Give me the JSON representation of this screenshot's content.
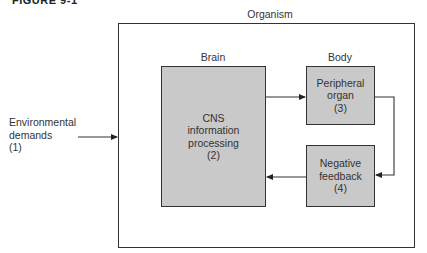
{
  "figure": {
    "title": "FIGURE 9-1"
  },
  "diagram": {
    "containers": {
      "organism": "Organism",
      "brain": "Brain",
      "body": "Body"
    },
    "nodes": [
      {
        "id": 1,
        "lines": [
          "Environmental",
          "demands",
          "(1)"
        ]
      },
      {
        "id": 2,
        "lines": [
          "CNS",
          "information",
          "processing",
          "(2)"
        ]
      },
      {
        "id": 3,
        "lines": [
          "Peripheral",
          "organ",
          "(3)"
        ]
      },
      {
        "id": 4,
        "lines": [
          "Negative",
          "feedback",
          "(4)"
        ]
      }
    ],
    "edges": [
      {
        "from": 1,
        "to": 2,
        "label": ""
      },
      {
        "from": 2,
        "to": 3,
        "label": ""
      },
      {
        "from": 3,
        "to": 4,
        "label": ""
      },
      {
        "from": 4,
        "to": 2,
        "label": ""
      }
    ],
    "colors": {
      "box_fill": "#c9c9c9",
      "stroke": "#333333",
      "background": "#ffffff"
    }
  }
}
